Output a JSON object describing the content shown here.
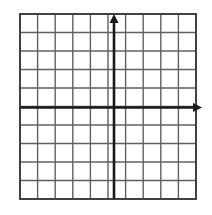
{
  "figure": {
    "title": "",
    "background_color": "#ffffff"
  },
  "chart_data": {
    "type": "scatter",
    "title": "",
    "subtitle": "",
    "xlabel": "",
    "ylabel": "",
    "x": [],
    "y": [],
    "series": [],
    "annotations": [],
    "grid": true,
    "legend": false,
    "legend_position": "none",
    "xlim": [
      -5,
      5
    ],
    "ylim": [
      -5,
      5
    ],
    "xticks": [
      -5,
      -4,
      -3,
      -2,
      -1,
      0,
      1,
      2,
      3,
      4,
      5
    ],
    "yticks": [
      -5,
      -4,
      -3,
      -2,
      -1,
      0,
      1,
      2,
      3,
      4,
      5
    ],
    "xtick_labels": [],
    "ytick_labels": [],
    "cells_x": 10,
    "cells_y": 10,
    "x_axis_row_index": 5,
    "y_axis_col_index": 5
  },
  "grid": {
    "columns": 10,
    "rows": 10,
    "left_px": 20,
    "top_px": 14,
    "right_px": 196,
    "bottom_px": 199,
    "line_color": "#606060",
    "border_color": "#3a3a3a",
    "line_width": 1.4,
    "border_width": 1.8
  },
  "axes": {
    "color": "#1a1a1a",
    "line_width": 2.6,
    "x_axis": {
      "name": "x-axis",
      "y_px": 107.5,
      "start_px": 20,
      "end_px": 202,
      "arrow": "right",
      "label": ""
    },
    "y_axis": {
      "name": "y-axis",
      "x_px": 114,
      "start_px": 199,
      "end_px": 14,
      "arrow": "up",
      "label": ""
    }
  }
}
